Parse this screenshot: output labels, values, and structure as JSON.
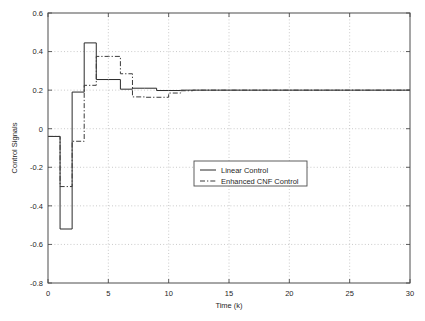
{
  "chart_data": {
    "type": "line",
    "title": "",
    "xlabel": "Time (k)",
    "ylabel": "Control Signals",
    "xlim": [
      0,
      30
    ],
    "ylim": [
      -0.8,
      0.6
    ],
    "xticks": [
      0,
      5,
      10,
      15,
      20,
      25,
      30
    ],
    "xtick_labels": [
      "0",
      "5",
      "10",
      "15",
      "20",
      "25",
      "30"
    ],
    "yticks": [
      -0.8,
      -0.6,
      -0.4,
      -0.2,
      0,
      0.2,
      0.4,
      0.6
    ],
    "ytick_labels": [
      "-0.8",
      "-0.6",
      "-0.4",
      "-0.2",
      "0",
      "0.2",
      "0.4",
      "0.6"
    ],
    "grid": true,
    "grid_style": "dotted",
    "legend_position": "center",
    "series": [
      {
        "name": "Linear Control",
        "style": "solid",
        "color": "#2a2a2a",
        "step": "post",
        "x": [
          0,
          1,
          2,
          3,
          4,
          5,
          6,
          7,
          8,
          9,
          10,
          11,
          12,
          13,
          14,
          15,
          16,
          17,
          18,
          19,
          20,
          21,
          22,
          23,
          24,
          25,
          26,
          27,
          28,
          29,
          30
        ],
        "y": [
          -0.04,
          -0.52,
          0.19,
          0.445,
          0.255,
          0.255,
          0.205,
          0.21,
          0.21,
          0.198,
          0.198,
          0.2,
          0.2,
          0.2,
          0.2,
          0.2,
          0.2,
          0.2,
          0.2,
          0.2,
          0.2,
          0.2,
          0.2,
          0.2,
          0.2,
          0.2,
          0.2,
          0.2,
          0.2,
          0.2,
          0.2
        ]
      },
      {
        "name": "Enhanced CNF Control",
        "style": "dashdot",
        "color": "#3a3a3a",
        "step": "post",
        "x": [
          0,
          1,
          2,
          3,
          4,
          5,
          6,
          7,
          8,
          9,
          10,
          11,
          12,
          13,
          14,
          15,
          16,
          17,
          18,
          19,
          20,
          21,
          22,
          23,
          24,
          25,
          26,
          27,
          28,
          29,
          30
        ],
        "y": [
          -0.04,
          -0.3,
          -0.065,
          0.225,
          0.375,
          0.375,
          0.285,
          0.165,
          0.163,
          0.163,
          0.185,
          0.197,
          0.2,
          0.2,
          0.2,
          0.2,
          0.2,
          0.2,
          0.2,
          0.2,
          0.2,
          0.2,
          0.2,
          0.2,
          0.2,
          0.2,
          0.2,
          0.2,
          0.2,
          0.2,
          0.2
        ]
      }
    ],
    "legend_entries": [
      {
        "label": "Linear Control",
        "style": "solid"
      },
      {
        "label": "Enhanced CNF Control",
        "style": "dashdot"
      }
    ],
    "colors": {
      "axis": "#4d4d4d",
      "grid": "#bdbdbd",
      "background": "#ffffff",
      "text": "#1f1f1f"
    }
  }
}
